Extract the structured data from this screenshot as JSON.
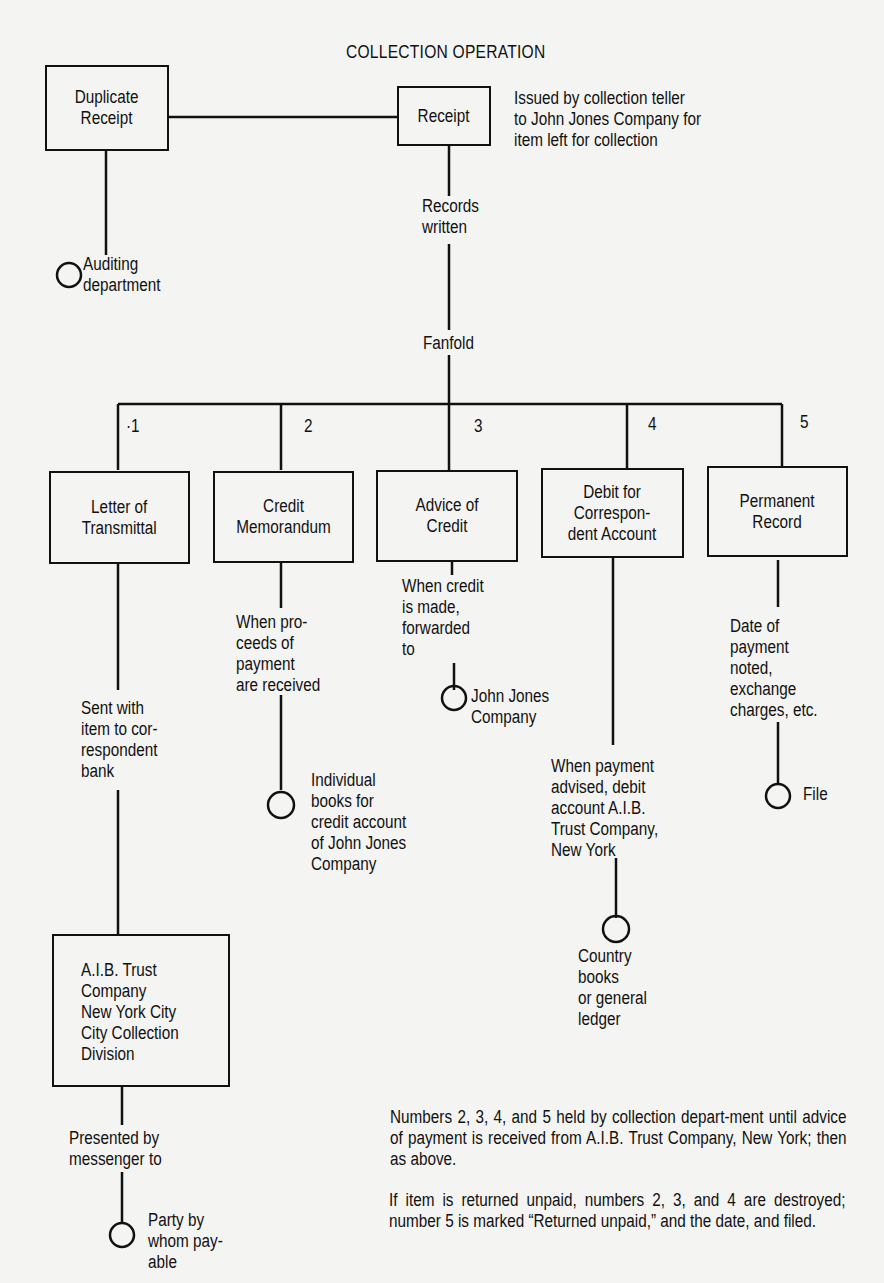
{
  "diagram": {
    "title": "COLLECTION OPERATION",
    "nodes": {
      "duplicate_receipt": "Duplicate\nReceipt",
      "receipt": "Receipt",
      "records_written": "Records\nwritten",
      "fanfold": "Fanfold",
      "auditing": "Auditing\ndepartment",
      "letter_of_transmittal": "Letter of\nTransmittal",
      "credit_memorandum": "Credit\nMemorandum",
      "advice_of_credit": "Advice of\nCredit",
      "debit_correspondent": "Debit for\nCorrespon-\ndent Account",
      "permanent_record": "Permanent\nRecord",
      "aib_trust": "A.I.B. Trust\nCompany\nNew York City\nCity Collection\nDivision"
    },
    "numbers": [
      "·1",
      "2",
      "3",
      "4",
      "5"
    ],
    "notes": {
      "receipt_note": "Issued by collection teller\nto John Jones Company for\nitem left for collection",
      "sent_with_item": "Sent with\nitem to cor-\nrespondent\nbank",
      "when_proceeds": "When pro-\nceeds of\npayment\nare received",
      "individual_books": "Individual\nbooks for\ncredit account\nof John Jones\nCompany",
      "when_credit": "When credit\nis made,\nforwarded\nto",
      "john_jones": "John Jones\nCompany",
      "when_payment": "When payment\nadvised, debit\naccount A.I.B.\nTrust Company,\nNew York",
      "country_books": "Country\nbooks\nor general\nledger",
      "date_of_payment": "Date of\npayment\nnoted,\nexchange\ncharges, etc.",
      "file": "File",
      "presented_by": "Presented by\nmessenger to",
      "party_payable": "Party by\nwhom pay-\nable"
    },
    "footnotes": [
      "Numbers 2, 3, 4, and 5 held by collection depart-ment until advice of payment is received from A.I.B. Trust Company, New York; then as above.",
      "If item is returned unpaid, numbers 2, 3, and 4 are destroyed; number 5 is marked “Returned unpaid,” and the date, and filed."
    ]
  }
}
